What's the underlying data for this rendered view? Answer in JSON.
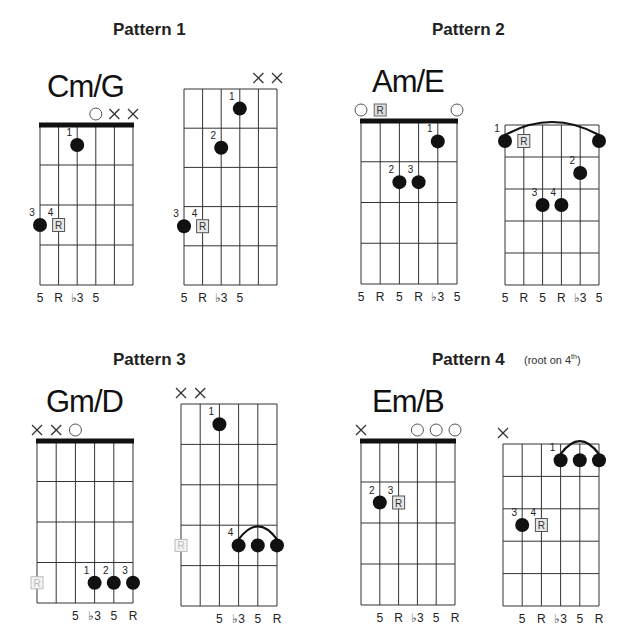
{
  "patterns": [
    {
      "title": "Pattern 1",
      "subtitle": "",
      "chord_name": "Cm/G",
      "diagrams": [
        {
          "nut": true,
          "string_markers": [
            "",
            "",
            "",
            "O",
            "X",
            "X"
          ],
          "dots": [
            {
              "string": 3,
              "fret": 1,
              "finger": "1",
              "type": "dot"
            },
            {
              "string": 1,
              "fret": 3,
              "finger": "3",
              "type": "dot"
            },
            {
              "string": 2,
              "fret": 3,
              "finger": "4",
              "type": "root"
            }
          ],
          "barre": null,
          "intervals": [
            "5",
            "R",
            "♭3",
            "5",
            "",
            ""
          ]
        },
        {
          "nut": false,
          "string_markers": [
            "",
            "",
            "",
            "",
            "X",
            "X"
          ],
          "dots": [
            {
              "string": 4,
              "fret": 1,
              "finger": "1",
              "type": "dot"
            },
            {
              "string": 3,
              "fret": 2,
              "finger": "2",
              "type": "dot"
            },
            {
              "string": 1,
              "fret": 4,
              "finger": "3",
              "type": "dot"
            },
            {
              "string": 2,
              "fret": 4,
              "finger": "4",
              "type": "root"
            }
          ],
          "barre": null,
          "intervals": [
            "5",
            "R",
            "♭3",
            "5",
            "",
            ""
          ]
        }
      ]
    },
    {
      "title": "Pattern 2",
      "subtitle": "",
      "chord_name": "Am/E",
      "diagrams": [
        {
          "nut": true,
          "string_markers": [
            "O",
            "R",
            "",
            "",
            "",
            "O"
          ],
          "dots": [
            {
              "string": 5,
              "fret": 1,
              "finger": "1",
              "type": "dot"
            },
            {
              "string": 3,
              "fret": 2,
              "finger": "2",
              "type": "dot"
            },
            {
              "string": 4,
              "fret": 2,
              "finger": "3",
              "type": "dot"
            }
          ],
          "barre": null,
          "intervals": [
            "5",
            "R",
            "5",
            "R",
            "♭3",
            "5"
          ]
        },
        {
          "nut": false,
          "string_markers": [
            "",
            "",
            "",
            "",
            "",
            ""
          ],
          "dots": [
            {
              "string": 1,
              "fret": 1,
              "finger": "1",
              "type": "dot"
            },
            {
              "string": 2,
              "fret": 1,
              "finger": "",
              "type": "root"
            },
            {
              "string": 6,
              "fret": 1,
              "finger": "",
              "type": "dot"
            },
            {
              "string": 5,
              "fret": 2,
              "finger": "2",
              "type": "dot"
            },
            {
              "string": 3,
              "fret": 3,
              "finger": "3",
              "type": "dot"
            },
            {
              "string": 4,
              "fret": 3,
              "finger": "4",
              "type": "dot"
            }
          ],
          "barre": {
            "fret": 1,
            "from": 1,
            "to": 6
          },
          "intervals": [
            "5",
            "R",
            "5",
            "R",
            "♭3",
            "5"
          ]
        }
      ]
    },
    {
      "title": "Pattern 3",
      "subtitle": "",
      "chord_name": "Gm/D",
      "diagrams": [
        {
          "nut": true,
          "string_markers": [
            "X",
            "X",
            "O",
            "",
            "",
            ""
          ],
          "dots": [
            {
              "string": 1,
              "fret": 4,
              "finger": "",
              "type": "ghost-root"
            },
            {
              "string": 4,
              "fret": 4,
              "finger": "1",
              "type": "dot"
            },
            {
              "string": 5,
              "fret": 4,
              "finger": "2",
              "type": "dot"
            },
            {
              "string": 6,
              "fret": 4,
              "finger": "3",
              "type": "dot"
            }
          ],
          "barre": null,
          "intervals": [
            "",
            "",
            "5",
            "♭3",
            "5",
            "R"
          ]
        },
        {
          "nut": false,
          "string_markers": [
            "X",
            "X",
            "",
            "",
            "",
            ""
          ],
          "dots": [
            {
              "string": 3,
              "fret": 1,
              "finger": "1",
              "type": "dot"
            },
            {
              "string": 1,
              "fret": 4,
              "finger": "",
              "type": "ghost-root"
            },
            {
              "string": 4,
              "fret": 4,
              "finger": "4",
              "type": "dot"
            },
            {
              "string": 5,
              "fret": 4,
              "finger": "",
              "type": "dot"
            },
            {
              "string": 6,
              "fret": 4,
              "finger": "",
              "type": "dot"
            }
          ],
          "barre": {
            "fret": 4,
            "from": 4,
            "to": 6
          },
          "intervals": [
            "",
            "",
            "5",
            "♭3",
            "5",
            "R"
          ]
        }
      ]
    },
    {
      "title": "Pattern 4",
      "subtitle": "(root on 4",
      "subtitle_sup": "th",
      "subtitle_end": ")",
      "chord_name": "Em/B",
      "diagrams": [
        {
          "nut": true,
          "string_markers": [
            "X",
            "",
            "",
            "O",
            "O",
            "O"
          ],
          "dots": [
            {
              "string": 2,
              "fret": 2,
              "finger": "2",
              "type": "dot"
            },
            {
              "string": 3,
              "fret": 2,
              "finger": "3",
              "type": "root"
            }
          ],
          "barre": null,
          "intervals": [
            "",
            "5",
            "R",
            "♭3",
            "5",
            "R"
          ]
        },
        {
          "nut": false,
          "string_markers": [
            "X",
            "",
            "",
            "",
            "",
            ""
          ],
          "dots": [
            {
              "string": 4,
              "fret": 1,
              "finger": "1",
              "type": "dot"
            },
            {
              "string": 5,
              "fret": 1,
              "finger": "",
              "type": "dot"
            },
            {
              "string": 6,
              "fret": 1,
              "finger": "",
              "type": "dot"
            },
            {
              "string": 2,
              "fret": 3,
              "finger": "3",
              "type": "dot"
            },
            {
              "string": 3,
              "fret": 3,
              "finger": "4",
              "type": "root"
            }
          ],
          "barre": {
            "fret": 1,
            "from": 4,
            "to": 6
          },
          "intervals": [
            "",
            "5",
            "R",
            "♭3",
            "5",
            "R"
          ]
        }
      ]
    }
  ]
}
